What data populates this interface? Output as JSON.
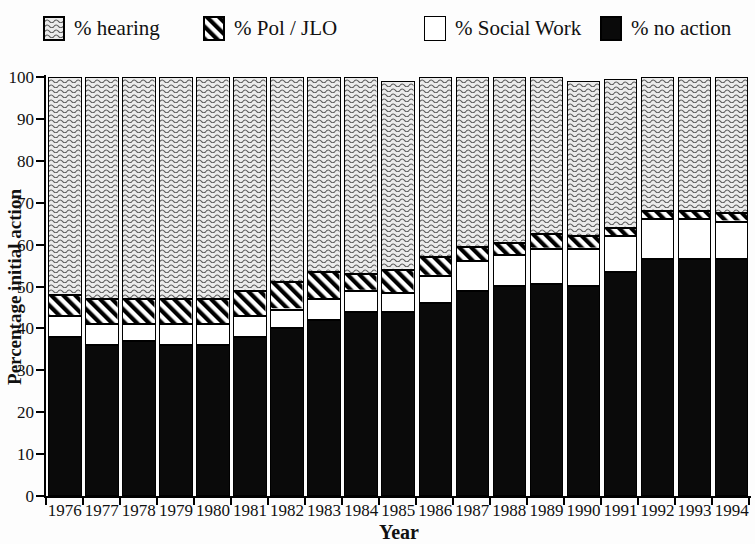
{
  "legend": {
    "items": [
      {
        "label": "% hearing",
        "pattern": "wave",
        "swatch_icon": "wave-pattern-swatch"
      },
      {
        "label": "% Pol / JLO",
        "pattern": "stripe",
        "swatch_icon": "diagonal-stripe-swatch"
      },
      {
        "label": "% Social Work",
        "pattern": "white",
        "swatch_icon": "white-swatch"
      },
      {
        "label": "% no action",
        "pattern": "black",
        "swatch_icon": "black-swatch"
      }
    ]
  },
  "axes": {
    "ylabel": "Percentage initial action",
    "xlabel": "Year"
  },
  "colors": {
    "bar_black": "#0a0a0a",
    "bar_white": "#ffffff",
    "pattern_ink": "#000000",
    "wave_background": "#ebebeb",
    "wave_line": "#5a5a5a",
    "axis": "#000000"
  },
  "chart_data": {
    "type": "bar",
    "stacked": true,
    "title": "",
    "xlabel": "Year",
    "ylabel": "Percentage initial action",
    "ylim": [
      0,
      100
    ],
    "ytick_step": 10,
    "grid": false,
    "legend_position": "top",
    "categories": [
      1976,
      1977,
      1978,
      1979,
      1980,
      1981,
      1982,
      1983,
      1984,
      1985,
      1986,
      1987,
      1988,
      1989,
      1990,
      1991,
      1992,
      1993,
      1994
    ],
    "series": [
      {
        "name": "% no action",
        "pattern": "black",
        "values": [
          38,
          36,
          37,
          36,
          36,
          38,
          40,
          42,
          44,
          44,
          46,
          49,
          50,
          50.5,
          50,
          53.5,
          56.5,
          56.5,
          56.5
        ]
      },
      {
        "name": "% Social Work",
        "pattern": "white",
        "values": [
          5,
          5,
          4,
          5,
          5,
          5,
          4.5,
          5,
          5,
          4.5,
          6.5,
          7,
          7.5,
          8.5,
          9,
          8.5,
          9.5,
          9.5,
          9
        ]
      },
      {
        "name": "% Pol / JLO",
        "pattern": "stripe",
        "values": [
          5,
          6,
          6,
          6,
          6,
          6,
          6.5,
          6.5,
          4,
          5.5,
          4.5,
          3.5,
          3,
          3.5,
          3,
          2,
          2,
          2,
          2
        ]
      },
      {
        "name": "% hearing",
        "pattern": "wave",
        "values": [
          52,
          53,
          53,
          53,
          53,
          51,
          49,
          46.5,
          47,
          45,
          43,
          40.5,
          39.5,
          37.5,
          37,
          35.5,
          32,
          32,
          32.5
        ]
      }
    ]
  }
}
